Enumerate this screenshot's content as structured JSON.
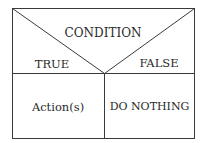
{
  "diagram": {
    "type": "decision-structure",
    "condition_label": "CONDITION",
    "true_label": "TRUE",
    "false_label": "FALSE",
    "true_action": "Action(s)",
    "false_action": "DO NOTHING",
    "colors": {
      "line": "#3a3a3a",
      "text": "#2a2a2a",
      "background": "#ffffff"
    }
  }
}
